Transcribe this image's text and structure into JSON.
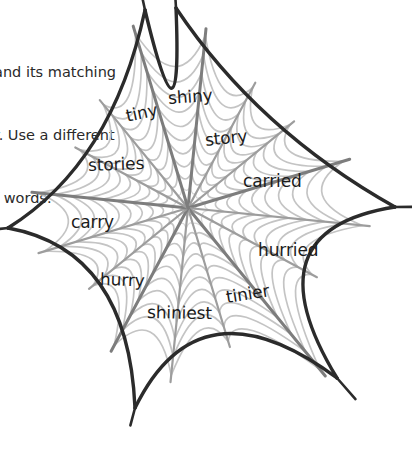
{
  "worksheet": {
    "instructions": {
      "line1": "and its matching",
      "line2": "r. Use a different",
      "line3": "f words."
    },
    "footer_note": "",
    "diagram": {
      "name": "spider-web-word-diagram",
      "type": "spider-web",
      "center": {
        "x": 188,
        "y": 208
      },
      "colors": {
        "frame": "#2b2b2b",
        "spoke": "#8a8a8a",
        "spiral": "#c9c9c9",
        "text": "#1b1b1b"
      },
      "anchors": [
        {
          "x": 145,
          "y": 10
        },
        {
          "x": 176,
          "y": 8
        },
        {
          "x": 395,
          "y": 207
        },
        {
          "x": 337,
          "y": 378
        },
        {
          "x": 135,
          "y": 408
        },
        {
          "x": 8,
          "y": 228
        }
      ],
      "words": [
        {
          "text": "shiny",
          "x": 168,
          "y": 100,
          "rot": -4,
          "size": 17
        },
        {
          "text": "tiny",
          "x": 126,
          "y": 118,
          "rot": -12,
          "size": 17
        },
        {
          "text": "story",
          "x": 205,
          "y": 142,
          "rot": -6,
          "size": 17
        },
        {
          "text": "stories",
          "x": 88,
          "y": 167,
          "rot": -2,
          "size": 17
        },
        {
          "text": "carried",
          "x": 243,
          "y": 183,
          "rot": 0,
          "size": 17
        },
        {
          "text": "carry",
          "x": 71,
          "y": 224,
          "rot": 0,
          "size": 17
        },
        {
          "text": "hurried",
          "x": 258,
          "y": 252,
          "rot": 0,
          "size": 17
        },
        {
          "text": "hurry",
          "x": 100,
          "y": 281,
          "rot": 2,
          "size": 17
        },
        {
          "text": "tinier",
          "x": 226,
          "y": 299,
          "rot": -9,
          "size": 17
        },
        {
          "text": "shiniest",
          "x": 147,
          "y": 314,
          "rot": 1,
          "size": 17
        }
      ]
    }
  }
}
